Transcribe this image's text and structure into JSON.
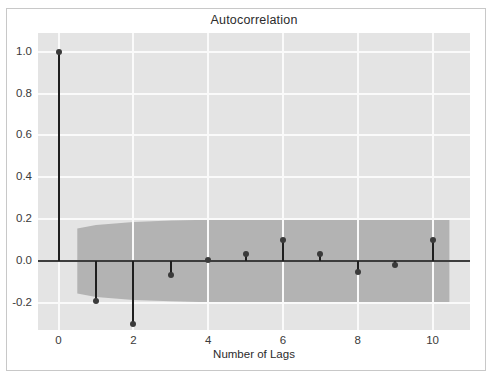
{
  "figure": {
    "title": "Autocorrelation",
    "background_color": "#ffffff",
    "panel_color": "#e4e4e4",
    "grid_color": "#fafafa",
    "frame_color": "#c8c8c8"
  },
  "chart_data": {
    "type": "bar",
    "title": "Autocorrelation",
    "xlabel": "Number of Lags",
    "ylabel": "",
    "categories": [
      0,
      1,
      2,
      3,
      4,
      5,
      6,
      7,
      8,
      9,
      10
    ],
    "values": [
      1.0,
      -0.19,
      -0.3,
      -0.065,
      0.005,
      0.035,
      0.1,
      0.035,
      -0.055,
      -0.02,
      0.1
    ],
    "series": [
      {
        "name": "Autocorrelation",
        "values": [
          1.0,
          -0.19,
          -0.3,
          -0.065,
          0.005,
          0.035,
          0.1,
          0.035,
          -0.055,
          -0.02,
          0.1
        ]
      }
    ],
    "confidence_band": {
      "label": "95% confidence interval",
      "color": "#b3b3b3",
      "x_start": 0.5,
      "x_end": 10.45,
      "upper": [
        0.155,
        0.172,
        0.186,
        0.193,
        0.197,
        0.198,
        0.199,
        0.2,
        0.2,
        0.2,
        0.2
      ],
      "lower": [
        -0.155,
        -0.172,
        -0.186,
        -0.193,
        -0.197,
        -0.198,
        -0.199,
        -0.2,
        -0.2,
        -0.2,
        -0.2
      ]
    },
    "xlim": [
      -0.55,
      11.0
    ],
    "ylim": [
      -0.33,
      1.09
    ],
    "xticks": [
      0,
      2,
      4,
      6,
      8,
      10
    ],
    "xtick_labels": [
      "0",
      "2",
      "4",
      "6",
      "8",
      "10"
    ],
    "yticks": [
      1.0,
      0.8,
      0.6,
      0.4,
      0.2,
      0.0,
      -0.2
    ],
    "ytick_labels": [
      "1.0",
      "0.8",
      "0.6",
      "0.4",
      "0.2",
      "0.0",
      "-0.2"
    ],
    "grid": true,
    "legend": null,
    "marker_color": "#3a3a3a",
    "stem_color": "#1f1f1f",
    "baseline_color": "#3d3d3d"
  }
}
